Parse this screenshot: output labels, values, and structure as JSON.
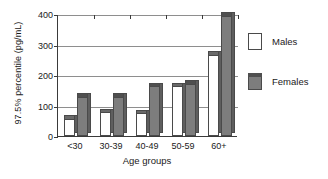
{
  "chart_data": {
    "type": "bar",
    "title": "",
    "xlabel": "Age groups",
    "ylabel": "97.5% percentile (pg/mL)",
    "categories": [
      "<30",
      "30-39",
      "40-49",
      "50-59",
      "60+"
    ],
    "series": [
      {
        "name": "Males",
        "color": "#ffffff",
        "values": [
          57,
          78,
          75,
          163,
          267
        ]
      },
      {
        "name": "Females",
        "color": "#7d7d7d",
        "values": [
          128,
          128,
          163,
          172,
          395
        ]
      }
    ],
    "ylim": [
      0,
      400
    ],
    "yticks": [
      "0",
      "100",
      "200",
      "300",
      "400"
    ],
    "ytick_values": [
      0,
      100,
      200,
      300,
      400
    ],
    "grid": "horizontal",
    "legend_position": "right"
  },
  "legend": {
    "items": [
      {
        "label": "Males"
      },
      {
        "label": "Females"
      }
    ]
  }
}
